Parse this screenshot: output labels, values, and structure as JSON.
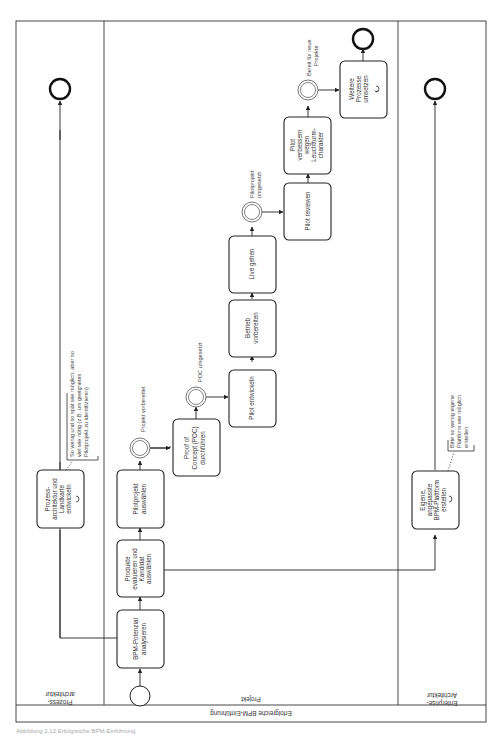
{
  "pool": {
    "label": "Erfolgreiche BPM-Einführung",
    "lanes": [
      {
        "id": "prozessarchitektur",
        "label_line1": "Prozess-",
        "label_line2": "architektur"
      },
      {
        "id": "projekt",
        "label": "Projekt"
      },
      {
        "id": "enterprise",
        "label_line1": "Enterprise-",
        "label_line2": "Architektur"
      }
    ]
  },
  "tasks": {
    "bpm_potenzial": [
      "BPM-Potenzial",
      "analysieren"
    ],
    "produkte": [
      "Produkte",
      "evaluieren und",
      "Kandidat",
      "auswählen"
    ],
    "pilotprojekt": [
      "Pilotprojekt",
      "auswählen"
    ],
    "poc": [
      "Proof of",
      "Concept (POC)",
      "durchführen"
    ],
    "pilot_entwickeln": [
      "Pilot entwickeln"
    ],
    "betrieb": [
      "Betrieb",
      "vorbereiten"
    ],
    "live": [
      "Live gehen"
    ],
    "pilot_reviewen": [
      "Pilot reviewen"
    ],
    "pilot_verbessern": [
      "Pilot",
      "verbessern",
      "wegen",
      "Leuchtturm-",
      "charakter"
    ],
    "weitere": [
      "Weitere",
      "Prozesse",
      "umsetzen"
    ],
    "prozessarchitektur": [
      "Prozess-",
      "architektur und",
      "Landkarte",
      "entwickeln"
    ],
    "plattform": [
      "Eigene,",
      "angepasste",
      "BPM-Plattform",
      "erstellen"
    ]
  },
  "events": {
    "projekt_vorbereitet": "Projekt vorbereitet",
    "poc_umgesetzt": "POC umgesetzt",
    "pilot_umgesetzt": [
      "Pilotprojekt",
      "umgesetzt"
    ],
    "bereit": [
      "Bereit für neue",
      "Projekte"
    ]
  },
  "annotations": {
    "prozessarchitektur": [
      "So wenig und so spät wie möglich, aber so",
      "viel wie nötig (z.B. um geeignetes",
      "Pilotprojekt zu identifizieren)"
    ],
    "plattform": [
      "Bitte so wenig eigene",
      "Plattform wie möglich",
      "erstellen"
    ]
  },
  "caption": "Abbildung 2.12 Erfolgreiche BPM-Einführung"
}
